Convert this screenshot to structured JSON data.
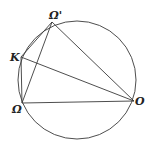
{
  "diagram": {
    "type": "geometry",
    "points": [
      {
        "id": "omega_prime",
        "label": "Ω'"
      },
      {
        "id": "k",
        "label": "K"
      },
      {
        "id": "omega",
        "label": "Ω"
      },
      {
        "id": "o",
        "label": "O"
      }
    ],
    "segments": [
      [
        "omega_prime",
        "k"
      ],
      [
        "k",
        "omega"
      ],
      [
        "omega",
        "omega_prime"
      ],
      [
        "omega_prime",
        "o"
      ],
      [
        "k",
        "o"
      ],
      [
        "omega",
        "o"
      ]
    ]
  }
}
